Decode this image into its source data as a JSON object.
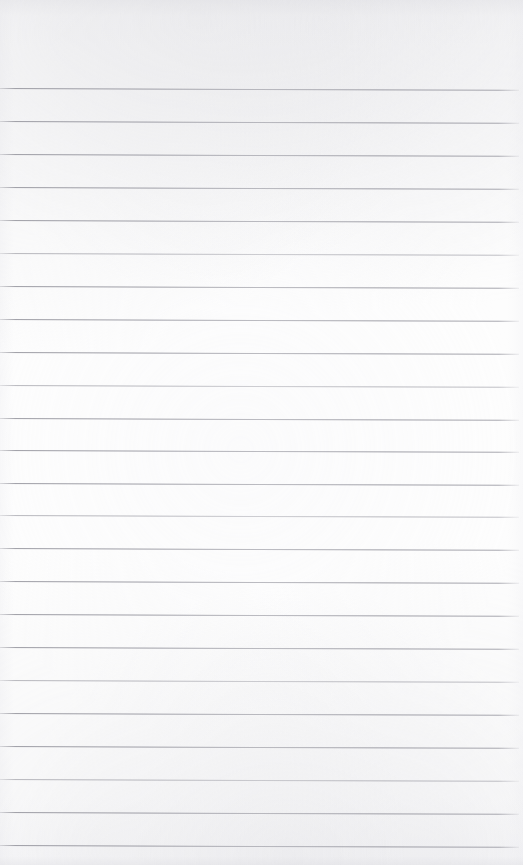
{
  "document": {
    "type": "scanned-page",
    "title": "Blank Lined Notebook Page",
    "content_text": "",
    "page_width": 523,
    "page_height": 865,
    "paper_color": "#fdfdfd",
    "rule_color": "#9a9aa0",
    "edge_shadow_color": "#e8e8eb",
    "skew_degrees": 0.2,
    "line_count": 24,
    "line_spacing": 32.8,
    "top_margin": 88,
    "rule_left": 0,
    "rule_right": 519
  },
  "rules": [
    {
      "index": 1,
      "y": 88,
      "weight": "normal"
    },
    {
      "index": 2,
      "y": 121,
      "weight": "normal"
    },
    {
      "index": 3,
      "y": 154,
      "weight": "normal"
    },
    {
      "index": 4,
      "y": 187,
      "weight": "normal"
    },
    {
      "index": 5,
      "y": 220,
      "weight": "normal"
    },
    {
      "index": 6,
      "y": 253,
      "weight": "soft"
    },
    {
      "index": 7,
      "y": 286,
      "weight": "normal"
    },
    {
      "index": 8,
      "y": 319,
      "weight": "normal"
    },
    {
      "index": 9,
      "y": 352,
      "weight": "normal"
    },
    {
      "index": 10,
      "y": 385,
      "weight": "soft"
    },
    {
      "index": 11,
      "y": 418,
      "weight": "normal"
    },
    {
      "index": 12,
      "y": 450,
      "weight": "normal"
    },
    {
      "index": 13,
      "y": 483,
      "weight": "normal"
    },
    {
      "index": 14,
      "y": 515,
      "weight": "soft"
    },
    {
      "index": 15,
      "y": 548,
      "weight": "normal"
    },
    {
      "index": 16,
      "y": 581,
      "weight": "normal"
    },
    {
      "index": 17,
      "y": 614,
      "weight": "normal"
    },
    {
      "index": 18,
      "y": 647,
      "weight": "normal"
    },
    {
      "index": 19,
      "y": 680,
      "weight": "soft"
    },
    {
      "index": 20,
      "y": 713,
      "weight": "normal"
    },
    {
      "index": 21,
      "y": 746,
      "weight": "normal"
    },
    {
      "index": 22,
      "y": 779,
      "weight": "soft"
    },
    {
      "index": 23,
      "y": 812,
      "weight": "normal"
    },
    {
      "index": 24,
      "y": 845,
      "weight": "normal"
    }
  ]
}
